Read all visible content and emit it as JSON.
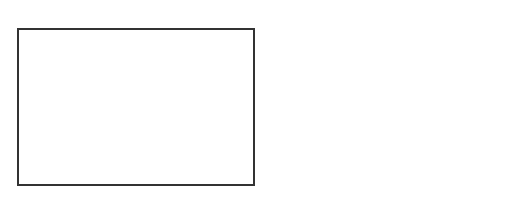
{
  "panel_a": {
    "label": "A",
    "points": [
      {
        "id": "25",
        "x": 112,
        "y": 39
      },
      {
        "id": "17",
        "x": 55,
        "y": 55
      },
      {
        "id": "18",
        "x": 83,
        "y": 49
      },
      {
        "id": "20",
        "x": 108,
        "y": 59
      },
      {
        "id": "27",
        "x": 211,
        "y": 56,
        "dark": true
      },
      {
        "id": "3",
        "x": 72,
        "y": 63
      },
      {
        "id": "4",
        "x": 88,
        "y": 64
      },
      {
        "id": "16",
        "x": 42,
        "y": 72
      },
      {
        "id": "7",
        "x": 61,
        "y": 74
      },
      {
        "id": "1",
        "x": 77,
        "y": 74
      },
      {
        "id": "5",
        "x": 96,
        "y": 75
      },
      {
        "id": "24",
        "x": 113,
        "y": 85
      },
      {
        "id": "8",
        "x": 60,
        "y": 84
      },
      {
        "id": "6",
        "x": 75,
        "y": 89
      },
      {
        "id": "2",
        "x": 90,
        "y": 87
      },
      {
        "id": "14",
        "x": 38,
        "y": 89
      },
      {
        "id": "12",
        "x": 49,
        "y": 99
      },
      {
        "id": "11",
        "x": 66,
        "y": 99
      },
      {
        "id": "9",
        "x": 89,
        "y": 98
      },
      {
        "id": "21",
        "x": 111,
        "y": 100
      },
      {
        "id": "23",
        "x": 86,
        "y": 114
      },
      {
        "id": "13",
        "x": 187,
        "y": 93
      },
      {
        "id": "15",
        "x": 205,
        "y": 93
      },
      {
        "id": "10",
        "x": 193,
        "y": 105
      },
      {
        "id": "19",
        "x": 211,
        "y": 105
      },
      {
        "id": "22",
        "x": 182,
        "y": 118
      },
      {
        "id": "26",
        "x": 54,
        "y": 139,
        "dark": true
      },
      {
        "id": "28",
        "x": 168,
        "y": 174,
        "dark": true
      }
    ]
  },
  "panel_b": {
    "label": "B",
    "xlabel": "ρ",
    "ylabel": "δ",
    "rho_min_label": "ρmin",
    "delta_min_label": "δmin",
    "x_ticks": [
      "0",
      "1",
      "2",
      "3",
      "4",
      "5",
      "6",
      "7",
      "8"
    ],
    "y_ticks": [
      "0.0",
      "0.2",
      "0.4",
      "0.6",
      "0.8",
      "1.0"
    ]
  },
  "chart_data": {
    "type": "scatter",
    "xlabel": "ρ",
    "ylabel": "δ",
    "xlim": [
      -0.4,
      8
    ],
    "ylim": [
      -0.1,
      1.1
    ],
    "grid": false,
    "thresholds": {
      "rho_min": 3.5,
      "delta_min": 0.7
    },
    "points": [
      {
        "label": "1",
        "x": 7.0,
        "y": 1.0
      },
      {
        "label": "10",
        "x": 4.0,
        "y": 0.8
      },
      {
        "label": "28",
        "x": 0.1,
        "y": 0.6
      },
      {
        "label": "26",
        "x": 0.3,
        "y": 0.4
      },
      {
        "label": "27",
        "x": 0.2,
        "y": 0.3
      },
      {
        "label": "25",
        "x": 0.5,
        "y": 0.15
      },
      {
        "label": "24",
        "x": 0.8,
        "y": 0.1
      },
      {
        "label": "20",
        "x": 1.1,
        "y": 0.1
      },
      {
        "label": "18",
        "x": 1.5,
        "y": 0.1
      },
      {
        "label": "19",
        "x": 1.5,
        "y": 0.05
      },
      {
        "label": "17",
        "x": 1.8,
        "y": 0.07
      },
      {
        "label": "15",
        "x": 2.5,
        "y": 0.05
      },
      {
        "label": "13",
        "x": 2.8,
        "y": 0.05
      },
      {
        "label": "22",
        "x": 3.0,
        "y": 0.03
      },
      {
        "label": "11",
        "x": 3.9,
        "y": 0.08
      },
      {
        "label": "9",
        "x": 4.1,
        "y": 0.03
      },
      {
        "label": "8",
        "x": 5.0,
        "y": 0.02
      },
      {
        "label": "7",
        "x": 5.3,
        "y": 0.04
      },
      {
        "label": "6",
        "x": 5.5,
        "y": 0.04
      },
      {
        "label": "5",
        "x": 5.6,
        "y": 0.05
      },
      {
        "label": "4",
        "x": 5.7,
        "y": 0.05
      },
      {
        "label": "3",
        "x": 5.75,
        "y": 0.06
      }
    ]
  }
}
